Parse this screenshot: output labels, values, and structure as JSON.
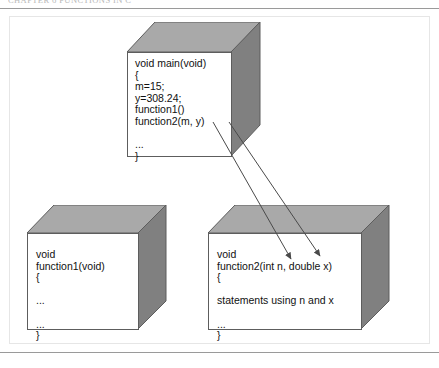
{
  "page": {
    "running_head": "CHAPTER  6   FUNCTIONS  IN  C",
    "background_color": "#ffffff",
    "rule_color": "#9a9a9a"
  },
  "figure": {
    "title": "",
    "box_colors": {
      "front_face": "#ffffff",
      "top_face": "#a9a9a9",
      "side_face": "#808080",
      "outline": "#5d5d5d",
      "text": "#111111",
      "arrow": "#4a4a4a"
    },
    "boxes": [
      {
        "id": "main-box",
        "name": "main-function-box",
        "lines": [
          "void main(void)",
          "{",
          "m=15;",
          "y=308.24;",
          "function1()",
          "function2(m, y)",
          "",
          "...",
          "}"
        ]
      },
      {
        "id": "function1-box",
        "name": "function1-box",
        "lines": [
          "void",
          "function1(void)",
          "{",
          "",
          "...",
          "",
          "...",
          "}"
        ]
      },
      {
        "id": "function2-box",
        "name": "function2-box",
        "lines": [
          "void",
          "function2(int n, double x)",
          "{",
          "",
          "statements using n and x",
          "",
          "...",
          "}"
        ]
      }
    ],
    "arrows": [
      {
        "id": "arrow-m-to-n",
        "name": "argument-arrow-m-to-n",
        "from_label": "m",
        "to_label": "int n"
      },
      {
        "id": "arrow-y-to-x",
        "name": "argument-arrow-y-to-x",
        "from_label": "y",
        "to_label": "double x"
      }
    ]
  }
}
